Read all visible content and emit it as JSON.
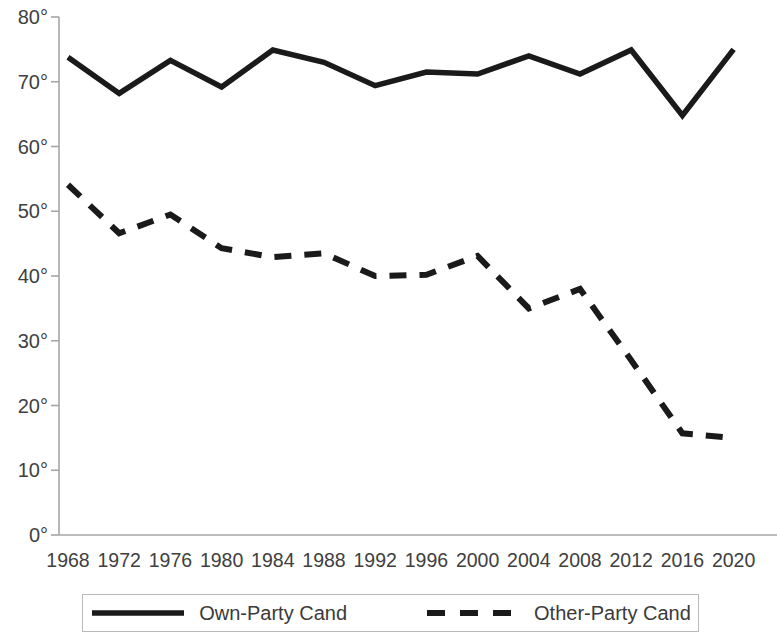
{
  "chart_data": {
    "type": "line",
    "title": "",
    "xlabel": "",
    "ylabel": "",
    "categories": [
      "1968",
      "1972",
      "1976",
      "1980",
      "1984",
      "1988",
      "1992",
      "1996",
      "2000",
      "2004",
      "2008",
      "2012",
      "2016",
      "2020"
    ],
    "ylim": [
      0,
      80
    ],
    "ytick_values": [
      0,
      10,
      20,
      30,
      40,
      50,
      60,
      70,
      80
    ],
    "ytick_labels": [
      "0°",
      "10°",
      "20°",
      "30°",
      "40°",
      "50°",
      "60°",
      "70°",
      "80°"
    ],
    "grid": false,
    "legend_position": "bottom",
    "series": [
      {
        "name": "Own-Party Cand",
        "style": "solid",
        "color": "#1a1a1a",
        "values": [
          73.8,
          68.2,
          73.3,
          69.2,
          74.9,
          73.0,
          69.4,
          71.5,
          71.2,
          74.0,
          71.2,
          74.9,
          64.8,
          75.0
        ]
      },
      {
        "name": "Other-Party Cand",
        "style": "dashed",
        "color": "#1a1a1a",
        "values": [
          54.1,
          46.6,
          49.5,
          44.3,
          42.9,
          43.5,
          40.0,
          40.2,
          43.1,
          35.0,
          38.0,
          27.0,
          15.7,
          15.0
        ]
      }
    ]
  },
  "legend": {
    "items": [
      {
        "label": "Own-Party Cand",
        "style": "solid"
      },
      {
        "label": "Other-Party Cand",
        "style": "dashed"
      }
    ]
  }
}
